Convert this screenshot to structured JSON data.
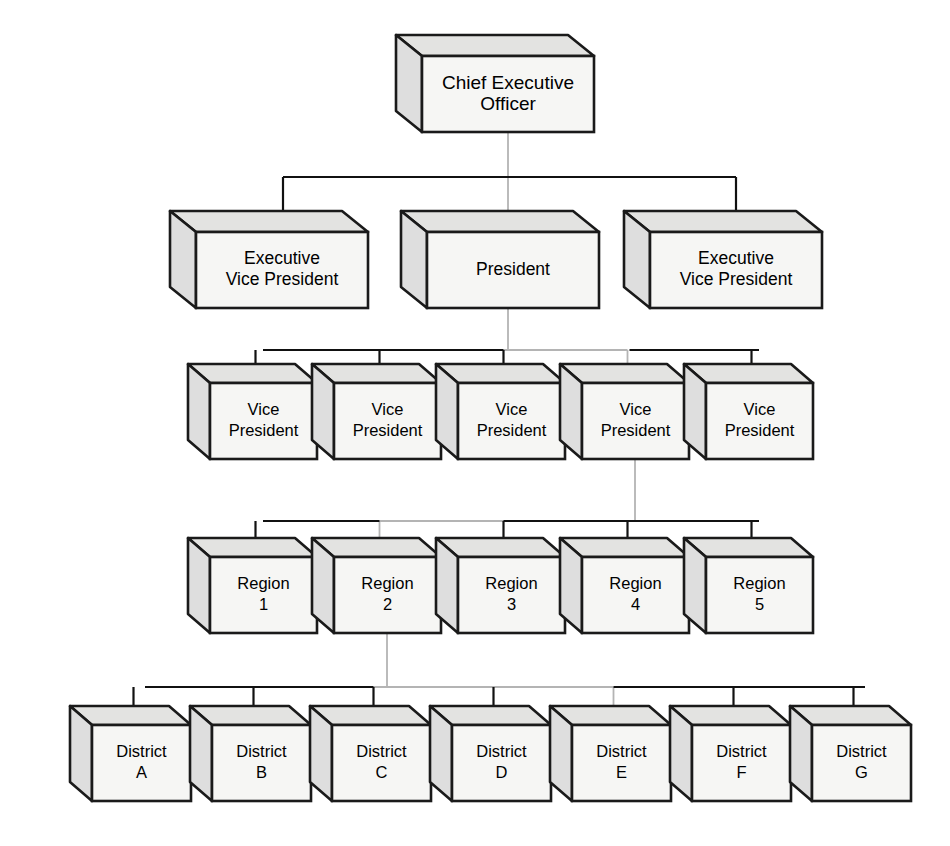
{
  "diagram": {
    "type": "organizational-hierarchy",
    "background_color": "#ffffff",
    "style": {
      "box_front_color": "#f6f6f4",
      "box_top_color": "#e3e3e1",
      "box_side_color": "#dedede",
      "outline_color": "#1a1a1a",
      "connector_color": "#111111",
      "ghost_connector_color": "#b4b4b4"
    }
  },
  "levels": [
    {
      "level": 1,
      "name": "executive",
      "nodes": [
        {
          "id": "ceo",
          "lines": [
            "Chief Executive",
            "Officer"
          ],
          "full_label": "Chief Executive Officer"
        }
      ]
    },
    {
      "level": 2,
      "name": "senior-executive",
      "nodes": [
        {
          "id": "evp-left",
          "lines": [
            "Executive",
            "Vice President"
          ],
          "full_label": "Executive Vice President"
        },
        {
          "id": "president",
          "lines": [
            "President"
          ],
          "full_label": "President"
        },
        {
          "id": "evp-right",
          "lines": [
            "Executive",
            "Vice President"
          ],
          "full_label": "Executive Vice President"
        }
      ]
    },
    {
      "level": 3,
      "name": "vice-presidents",
      "nodes": [
        {
          "id": "vp-1",
          "lines": [
            "Vice",
            "President"
          ],
          "full_label": "Vice President"
        },
        {
          "id": "vp-2",
          "lines": [
            "Vice",
            "President"
          ],
          "full_label": "Vice President"
        },
        {
          "id": "vp-3",
          "lines": [
            "Vice",
            "President"
          ],
          "full_label": "Vice President"
        },
        {
          "id": "vp-4",
          "lines": [
            "Vice",
            "President"
          ],
          "full_label": "Vice President"
        },
        {
          "id": "vp-5",
          "lines": [
            "Vice",
            "President"
          ],
          "full_label": "Vice President"
        }
      ]
    },
    {
      "level": 4,
      "name": "regions",
      "nodes": [
        {
          "id": "region-1",
          "lines": [
            "Region",
            "1"
          ],
          "full_label": "Region 1"
        },
        {
          "id": "region-2",
          "lines": [
            "Region",
            "2"
          ],
          "full_label": "Region 2"
        },
        {
          "id": "region-3",
          "lines": [
            "Region",
            "3"
          ],
          "full_label": "Region 3"
        },
        {
          "id": "region-4",
          "lines": [
            "Region",
            "4"
          ],
          "full_label": "Region 4"
        },
        {
          "id": "region-5",
          "lines": [
            "Region",
            "5"
          ],
          "full_label": "Region 5"
        }
      ]
    },
    {
      "level": 5,
      "name": "districts",
      "nodes": [
        {
          "id": "district-a",
          "lines": [
            "District",
            "A"
          ],
          "full_label": "District A"
        },
        {
          "id": "district-b",
          "lines": [
            "District",
            "B"
          ],
          "full_label": "District B"
        },
        {
          "id": "district-c",
          "lines": [
            "District",
            "C"
          ],
          "full_label": "District C"
        },
        {
          "id": "district-d",
          "lines": [
            "District",
            "D"
          ],
          "full_label": "District D"
        },
        {
          "id": "district-e",
          "lines": [
            "District",
            "E"
          ],
          "full_label": "District E"
        },
        {
          "id": "district-f",
          "lines": [
            "District",
            "F"
          ],
          "full_label": "District F"
        },
        {
          "id": "district-g",
          "lines": [
            "District",
            "G"
          ],
          "full_label": "District G"
        }
      ]
    }
  ],
  "geometry": {
    "canvas": {
      "width": 950,
      "height": 846
    },
    "rows": [
      {
        "name": "executive",
        "front_y": 56,
        "front_h": 76,
        "depth_x": 26,
        "depth_y": 21,
        "font": "lbl-lg",
        "boxes": [
          {
            "x": 408,
            "w": 172
          }
        ]
      },
      {
        "name": "senior-executive",
        "front_y": 232,
        "front_h": 76,
        "depth_x": 26,
        "depth_y": 21,
        "font": "lbl-md",
        "boxes": [
          {
            "x": 182,
            "w": 172
          },
          {
            "x": 413,
            "w": 172
          },
          {
            "x": 636,
            "w": 172
          }
        ]
      },
      {
        "name": "vice-presidents",
        "front_y": 383,
        "front_h": 76,
        "depth_x": 22,
        "depth_y": 19,
        "font": "lbl-sm",
        "boxes": [
          {
            "x": 196,
            "w": 107
          },
          {
            "x": 320,
            "w": 107
          },
          {
            "x": 444,
            "w": 107
          },
          {
            "x": 568,
            "w": 107
          },
          {
            "x": 692,
            "w": 107
          }
        ]
      },
      {
        "name": "regions",
        "front_y": 557,
        "front_h": 76,
        "depth_x": 22,
        "depth_y": 19,
        "font": "lbl-sm",
        "boxes": [
          {
            "x": 196,
            "w": 107
          },
          {
            "x": 320,
            "w": 107
          },
          {
            "x": 444,
            "w": 107
          },
          {
            "x": 568,
            "w": 107
          },
          {
            "x": 692,
            "w": 107
          }
        ]
      },
      {
        "name": "districts",
        "front_y": 725,
        "front_h": 76,
        "depth_x": 22,
        "depth_y": 19,
        "font": "lbl-sm",
        "boxes": [
          {
            "x": 78,
            "w": 99
          },
          {
            "x": 198,
            "w": 99
          },
          {
            "x": 318,
            "w": 99
          },
          {
            "x": 438,
            "w": 99
          },
          {
            "x": 558,
            "w": 99
          },
          {
            "x": 678,
            "w": 99
          },
          {
            "x": 798,
            "w": 99
          }
        ]
      }
    ],
    "connectors": {
      "ceo_stem": {
        "x": 494,
        "y1": 132,
        "y2": 310
      },
      "bus_level2": {
        "y": 177,
        "x1": 269,
        "x2": 722
      },
      "bus_level3": {
        "y": 350,
        "x1": 249,
        "x2": 745
      },
      "bus_level4": {
        "y": 521,
        "x1": 249,
        "x2": 745
      },
      "bus_level5": {
        "y": 687,
        "x1": 131,
        "x2": 851
      },
      "pres_stem_down": {
        "x": 494,
        "y1": 308,
        "y2": 350
      },
      "vp4_stem_down": {
        "x": 621,
        "y1": 459,
        "y2": 521
      },
      "region2_stem_down": {
        "x": 373,
        "y1": 633,
        "y2": 687
      }
    }
  }
}
